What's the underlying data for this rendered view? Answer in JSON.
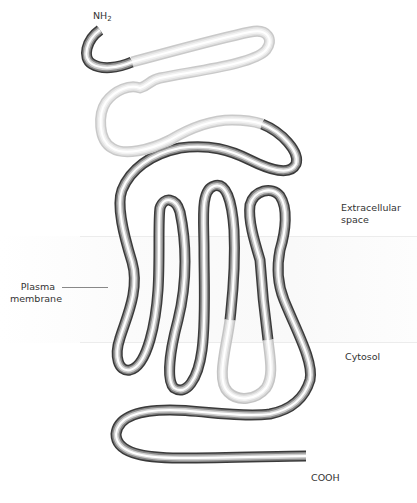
{
  "diagram": {
    "labels": {
      "n_terminus": "NH",
      "n_terminus_sub": "2",
      "extracellular": "Extracellular space",
      "extracellular_line1": "Extracellular",
      "extracellular_line2": "space",
      "plasma_membrane_line1": "Plasma",
      "plasma_membrane_line2": "membrane",
      "cytosol": "Cytosol",
      "c_terminus": "COOH"
    },
    "regions": [
      {
        "name": "Extracellular space",
        "y_range": [
          0,
          236
        ]
      },
      {
        "name": "Plasma membrane",
        "y_range": [
          236,
          343
        ]
      },
      {
        "name": "Cytosol",
        "y_range": [
          343,
          503
        ]
      }
    ],
    "transmembrane_helices": 7,
    "colors": {
      "tube_dark": "#3a3a3a",
      "tube_mid": "#9a9a9a",
      "tube_light": "#ffffff",
      "highlight_segment": "#d9d9d9",
      "membrane_band": "#f8f8f8",
      "text": "#333333"
    }
  }
}
